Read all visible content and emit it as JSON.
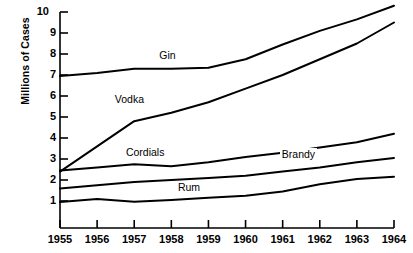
{
  "chart_data": {
    "type": "line",
    "title": "",
    "xlabel": "",
    "ylabel": "Millions of Cases",
    "categories": [
      "1955",
      "1956",
      "1957",
      "1958",
      "1959",
      "1960",
      "1961",
      "1962",
      "1963",
      "1964"
    ],
    "x": [
      1955,
      1956,
      1957,
      1958,
      1959,
      1960,
      1961,
      1962,
      1963,
      1964
    ],
    "xlim": [
      1955,
      1964
    ],
    "ylim": [
      0,
      10
    ],
    "yticks": [
      "1",
      "2",
      "3",
      "4",
      "5",
      "6",
      "7",
      "8",
      "9",
      "10"
    ],
    "grid": false,
    "legend": "inline-labels",
    "series": [
      {
        "name": "Gin",
        "values": [
          6.95,
          7.1,
          7.3,
          7.3,
          7.35,
          7.75,
          8.45,
          9.1,
          9.65,
          10.3
        ]
      },
      {
        "name": "Vodka",
        "values": [
          2.4,
          3.6,
          4.8,
          5.2,
          5.7,
          6.35,
          7.0,
          7.75,
          8.5,
          9.5
        ]
      },
      {
        "name": "Cordials",
        "values": [
          2.45,
          2.6,
          2.75,
          2.65,
          2.85,
          3.1,
          3.3,
          3.55,
          3.8,
          4.2
        ]
      },
      {
        "name": "Brandy",
        "values": [
          1.6,
          1.75,
          1.9,
          2.0,
          2.1,
          2.2,
          2.4,
          2.6,
          2.85,
          3.05
        ]
      },
      {
        "name": "Rum",
        "values": [
          0.95,
          1.1,
          0.97,
          1.05,
          1.15,
          1.25,
          1.45,
          1.8,
          2.05,
          2.15
        ]
      }
    ],
    "annotations": [
      {
        "text": "Gin",
        "x": 1958.0,
        "y": 7.95
      },
      {
        "text": "Vodka",
        "x": 1956.8,
        "y": 5.85
      },
      {
        "text": "Cordials",
        "x": 1957.1,
        "y": 3.35
      },
      {
        "text": "Brandy",
        "x": 1961.3,
        "y": 3.25
      },
      {
        "text": "Rum",
        "x": 1958.5,
        "y": 1.65
      }
    ],
    "colors": {
      "line": "#000000",
      "axis": "#000000",
      "background": "#ffffff",
      "text": "#000000"
    }
  }
}
